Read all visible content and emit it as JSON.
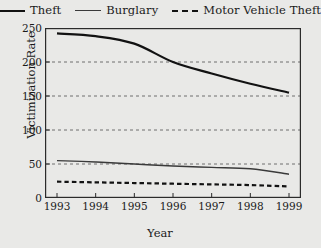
{
  "chart_data": {
    "type": "line",
    "title": "",
    "xlabel": "Year",
    "ylabel": "Victimization Rate",
    "x": [
      1993,
      1994,
      1995,
      1996,
      1997,
      1998,
      1999
    ],
    "categories": [
      "1993",
      "1994",
      "1995",
      "1996",
      "1997",
      "1998",
      "1999"
    ],
    "series": [
      {
        "name": "Theft",
        "style": "solid",
        "color": "#121212",
        "width": 2.2,
        "values": [
          242,
          238,
          227,
          200,
          183,
          168,
          155
        ]
      },
      {
        "name": "Burglary",
        "style": "solid",
        "color": "#3a3a3a",
        "width": 1.4,
        "values": [
          55,
          53,
          50,
          47,
          45,
          43,
          35
        ]
      },
      {
        "name": "Motor Vehicle Theft",
        "style": "dashed",
        "color": "#121212",
        "width": 2.2,
        "values": [
          24,
          23,
          22,
          21,
          20,
          19,
          17
        ]
      }
    ],
    "ylim": [
      0,
      250
    ],
    "yticks": [
      0,
      50,
      100,
      150,
      200,
      250
    ],
    "ytick_labels": [
      "0",
      "50",
      "100",
      "150",
      "200",
      "250"
    ],
    "xlim": [
      1993,
      1999
    ],
    "grid": "horizontal-dashed",
    "legend_position": "top-center",
    "plot_background": "#e9e9e7",
    "frame_color": "#2b2b2b"
  },
  "legend": {
    "entries": [
      {
        "label": "Theft",
        "swatch": "solid-thick-line-icon"
      },
      {
        "label": "Burglary",
        "swatch": "solid-thin-line-icon"
      },
      {
        "label": "Motor Vehicle Theft",
        "swatch": "dashed-line-icon"
      }
    ]
  },
  "axes": {
    "y_title": "Victimization Rate",
    "x_title": "Year"
  }
}
